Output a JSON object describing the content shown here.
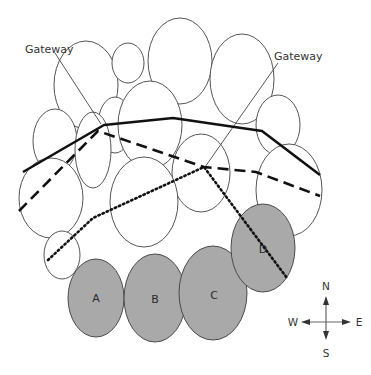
{
  "diagram": {
    "type": "cluster-map",
    "gateway_labels": [
      "Gateway",
      "Gateway"
    ],
    "zones": [
      {
        "id": "A",
        "label": "A"
      },
      {
        "id": "B",
        "label": "B"
      },
      {
        "id": "C",
        "label": "C"
      },
      {
        "id": "D",
        "label": "D"
      }
    ],
    "paths": [
      {
        "style": "solid",
        "name": "solid-path"
      },
      {
        "style": "dashed",
        "name": "dashed-path"
      },
      {
        "style": "dotted",
        "name": "dotted-path"
      }
    ],
    "compass": {
      "north": "N",
      "south": "S",
      "east": "E",
      "west": "W"
    },
    "colors": {
      "shaded_zone": "#a9a9a9",
      "outline": "#555555",
      "path": "#111111"
    }
  }
}
